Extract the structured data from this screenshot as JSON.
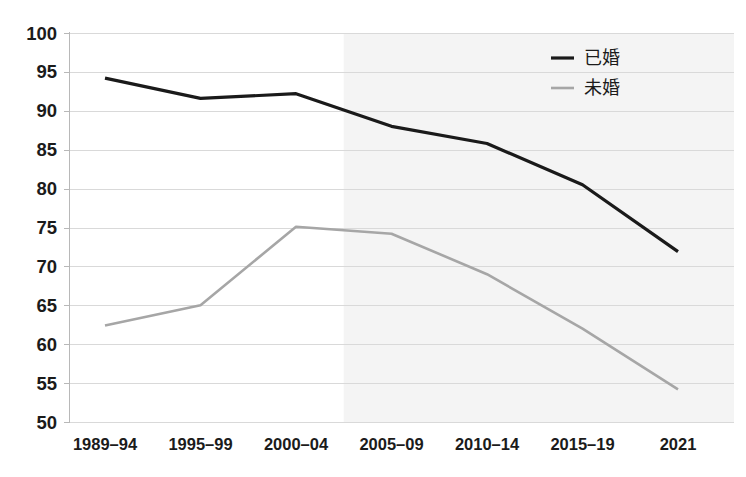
{
  "chart_data": {
    "type": "line",
    "title": "",
    "subtitle": "",
    "xlabel": "",
    "ylabel": "",
    "categories": [
      "1989–94",
      "1995–99",
      "2000–04",
      "2005–09",
      "2010–14",
      "2015–19",
      "2021"
    ],
    "ylim": [
      50,
      100
    ],
    "ytick_values": [
      50,
      55,
      60,
      65,
      70,
      75,
      80,
      85,
      90,
      95,
      100
    ],
    "ytick_labels": [
      "50",
      "55",
      "60",
      "65",
      "70",
      "75",
      "80",
      "85",
      "90",
      "95",
      "100"
    ],
    "grid": true,
    "grid_axis": "y",
    "legend_position": "top-right",
    "series": [
      {
        "name": "已婚",
        "color": "#1a1a1a",
        "width": 3.2,
        "values": [
          94.2,
          91.6,
          92.2,
          88.0,
          85.8,
          80.5,
          71.9
        ]
      },
      {
        "name": "未婚",
        "color": "#a6a6a6",
        "width": 2.6,
        "values": [
          62.4,
          65.0,
          75.1,
          74.2,
          69.0,
          62.0,
          54.2
        ]
      }
    ],
    "shaded_region": {
      "from_category": "2005–09",
      "to_category": "2021",
      "color": "#f2f2f2",
      "label": ""
    }
  },
  "axes": {
    "y_axis_name": "percent-axis",
    "x_axis_name": "period-axis"
  },
  "legend": {
    "entries": [
      {
        "label": "已婚",
        "color": "#1a1a1a"
      },
      {
        "label": "未婚",
        "color": "#a6a6a6"
      }
    ]
  },
  "colors": {
    "background": "#ffffff",
    "gridline": "#d9d9d9",
    "axis": "#b8b8b8",
    "text": "#1b1b1b",
    "married_series": "#1a1a1a",
    "unmarried_series": "#a6a6a6",
    "shade": "#f2f2f2"
  }
}
